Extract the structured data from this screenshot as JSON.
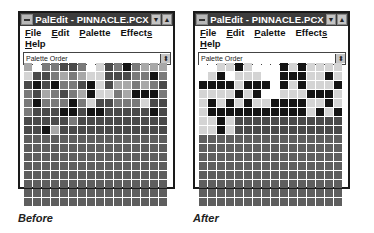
{
  "windows": [
    {
      "id": "before",
      "title": "PalEdit - PINNACLE.PCX",
      "menu": {
        "row1": [
          {
            "label": "File",
            "mnemonic_index": 0
          },
          {
            "label": "Edit",
            "mnemonic_index": 0
          },
          {
            "label": "Palette",
            "mnemonic_index": 0
          },
          {
            "label": "Effects",
            "mnemonic_index": 6
          }
        ],
        "row2": [
          {
            "label": "Help",
            "mnemonic_index": 0
          }
        ]
      },
      "dropdown": {
        "value": "Palette Order"
      },
      "caption": "Before",
      "grid": [
        [
          2,
          0,
          3,
          3,
          4,
          4,
          3,
          0,
          1,
          4,
          3,
          5,
          3,
          2,
          2,
          2
        ],
        [
          1,
          4,
          4,
          3,
          2,
          3,
          2,
          1,
          1,
          4,
          4,
          4,
          3,
          3,
          5,
          3
        ],
        [
          4,
          5,
          4,
          5,
          3,
          3,
          4,
          5,
          1,
          4,
          2,
          2,
          3,
          2,
          3,
          4
        ],
        [
          3,
          4,
          2,
          3,
          4,
          3,
          2,
          5,
          1,
          1,
          3,
          2,
          5,
          5,
          5,
          3
        ],
        [
          3,
          5,
          3,
          3,
          3,
          5,
          3,
          1,
          4,
          4,
          3,
          3,
          3,
          1,
          4,
          4
        ],
        [
          3,
          4,
          4,
          4,
          5,
          5,
          4,
          5,
          5,
          4,
          4,
          4,
          4,
          4,
          5,
          4
        ],
        [
          4,
          4,
          4,
          4,
          4,
          3,
          4,
          4,
          4,
          4,
          4,
          4,
          4,
          4,
          4,
          4
        ],
        [
          4,
          4,
          5,
          2,
          4,
          4,
          4,
          4,
          4,
          4,
          4,
          4,
          4,
          4,
          4,
          4
        ],
        [
          6,
          6,
          6,
          6,
          6,
          6,
          6,
          6,
          6,
          6,
          6,
          6,
          6,
          6,
          6,
          6
        ],
        [
          6,
          6,
          6,
          6,
          6,
          6,
          6,
          6,
          6,
          6,
          6,
          6,
          6,
          6,
          6,
          6
        ],
        [
          6,
          6,
          6,
          6,
          6,
          6,
          6,
          6,
          6,
          6,
          6,
          6,
          6,
          6,
          6,
          6
        ],
        [
          6,
          6,
          6,
          6,
          6,
          6,
          6,
          6,
          6,
          6,
          6,
          6,
          6,
          6,
          6,
          6
        ],
        [
          6,
          6,
          6,
          6,
          6,
          6,
          6,
          6,
          6,
          6,
          6,
          6,
          6,
          6,
          6,
          6
        ],
        [
          6,
          6,
          6,
          6,
          6,
          6,
          6,
          6,
          6,
          6,
          6,
          6,
          6,
          6,
          6,
          6
        ],
        [
          6,
          6,
          6,
          6,
          6,
          6,
          6,
          6,
          6,
          6,
          6,
          6,
          6,
          6,
          6,
          6
        ],
        [
          6,
          6,
          6,
          6,
          6,
          6,
          6,
          6,
          6,
          6,
          6,
          6,
          6,
          6,
          6,
          6
        ]
      ]
    },
    {
      "id": "after",
      "title": "PalEdit - PINNACLE.PCX",
      "menu": {
        "row1": [
          {
            "label": "File",
            "mnemonic_index": 0
          },
          {
            "label": "Edit",
            "mnemonic_index": 0
          },
          {
            "label": "Palette",
            "mnemonic_index": 0
          },
          {
            "label": "Effects",
            "mnemonic_index": 6
          }
        ],
        "row2": [
          {
            "label": "Help",
            "mnemonic_index": 0
          }
        ]
      },
      "dropdown": {
        "value": "Palette Order"
      },
      "caption": "After",
      "grid": [
        [
          0,
          0,
          1,
          1,
          5,
          1,
          0,
          0,
          0,
          5,
          1,
          5,
          1,
          1,
          1,
          1
        ],
        [
          0,
          1,
          5,
          0,
          1,
          1,
          1,
          0,
          0,
          5,
          5,
          5,
          1,
          1,
          5,
          1
        ],
        [
          5,
          5,
          5,
          5,
          1,
          5,
          5,
          5,
          0,
          5,
          1,
          5,
          1,
          1,
          1,
          5
        ],
        [
          1,
          1,
          1,
          1,
          5,
          1,
          5,
          0,
          0,
          1,
          1,
          1,
          5,
          5,
          5,
          1
        ],
        [
          1,
          5,
          1,
          5,
          1,
          5,
          1,
          1,
          5,
          5,
          5,
          5,
          1,
          1,
          5,
          1
        ],
        [
          1,
          5,
          5,
          5,
          5,
          5,
          5,
          5,
          5,
          5,
          5,
          5,
          1,
          5,
          1,
          5
        ],
        [
          1,
          1,
          5,
          1,
          4,
          4,
          4,
          4,
          4,
          4,
          4,
          4,
          4,
          4,
          4,
          4
        ],
        [
          1,
          1,
          5,
          1,
          4,
          4,
          4,
          4,
          4,
          4,
          4,
          4,
          4,
          4,
          4,
          4
        ],
        [
          6,
          6,
          6,
          6,
          6,
          6,
          6,
          6,
          6,
          6,
          6,
          6,
          6,
          6,
          6,
          6
        ],
        [
          6,
          6,
          6,
          6,
          6,
          6,
          6,
          6,
          6,
          6,
          6,
          6,
          6,
          6,
          6,
          6
        ],
        [
          6,
          6,
          6,
          6,
          6,
          6,
          6,
          6,
          6,
          6,
          6,
          6,
          6,
          6,
          6,
          6
        ],
        [
          6,
          6,
          6,
          6,
          6,
          6,
          6,
          6,
          6,
          6,
          6,
          6,
          6,
          6,
          6,
          6
        ],
        [
          6,
          6,
          6,
          6,
          6,
          6,
          6,
          6,
          6,
          6,
          6,
          6,
          6,
          6,
          6,
          6
        ],
        [
          6,
          6,
          6,
          6,
          6,
          6,
          6,
          6,
          6,
          6,
          6,
          6,
          6,
          6,
          6,
          6
        ],
        [
          6,
          6,
          6,
          6,
          6,
          6,
          6,
          6,
          6,
          6,
          6,
          6,
          6,
          6,
          6,
          6
        ],
        [
          6,
          6,
          6,
          6,
          6,
          6,
          6,
          6,
          6,
          6,
          6,
          6,
          6,
          6,
          6,
          6
        ]
      ]
    }
  ],
  "icons": {
    "system_menu": "system-menu-icon",
    "minimize": "minimize-icon",
    "maximize": "maximize-icon",
    "dropdown_arrow": "dropdown-arrow-icon"
  },
  "glyphs": {
    "minimize": "▼",
    "maximize": "▲",
    "dropdown": "⬍"
  }
}
